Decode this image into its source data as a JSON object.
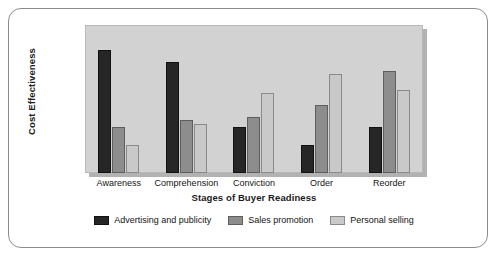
{
  "chart_data": {
    "type": "bar",
    "title": "",
    "xlabel": "Stages of Buyer Readiness",
    "ylabel": "Cost Effectiveness",
    "categories": [
      "Awareness",
      "Comprehension",
      "Conviction",
      "Order",
      "Reorder"
    ],
    "series": [
      {
        "name": "Advertising and publicity",
        "color": "#262626",
        "values": [
          83,
          75,
          31,
          19,
          31
        ]
      },
      {
        "name": "Sales promotion",
        "color": "#8d8d8d",
        "values": [
          31,
          36,
          38,
          46,
          69
        ]
      },
      {
        "name": "Personal selling",
        "color": "#c9c9c9",
        "values": [
          19,
          33,
          54,
          67,
          56
        ]
      }
    ],
    "ylim": [
      0,
      100
    ],
    "grid": false,
    "legend_position": "bottom",
    "y_tick_labels": [],
    "x_tick_labels": [
      "Awareness",
      "Comprehension",
      "Conviction",
      "Order",
      "Reorder"
    ]
  },
  "figure": {
    "plot_background_color": "#d2d2d2",
    "frame_color": "#8c8c8c",
    "page_background_color": "#ffffff"
  }
}
